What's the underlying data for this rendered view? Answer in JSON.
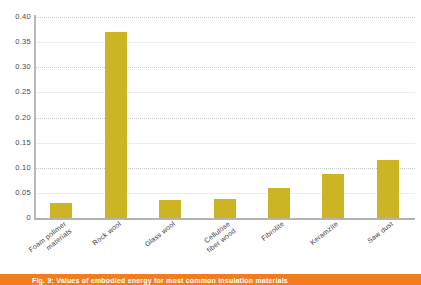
{
  "chart_data": {
    "type": "bar",
    "title": "",
    "xlabel": "",
    "ylabel": "",
    "ylim": [
      0,
      0.4
    ],
    "grid": true,
    "legend": false,
    "bar_color": "#cdb424",
    "categories": [
      "Foam polimer materials",
      "Rock wool",
      "Glass wool",
      "Cellulose fiber wood",
      "Fibrolite",
      "Keramzite",
      "Saw dust"
    ],
    "category_lines": [
      [
        "Foam polimer",
        "materials"
      ],
      [
        "Rock wool",
        ""
      ],
      [
        "Glass wool",
        ""
      ],
      [
        "Cellulose",
        "fiber wood"
      ],
      [
        "Fibrolite",
        ""
      ],
      [
        "Keramzite",
        ""
      ],
      [
        "Saw dust",
        ""
      ]
    ],
    "values": [
      0.03,
      0.37,
      0.036,
      0.038,
      0.06,
      0.087,
      0.116
    ],
    "ytick_values": [
      0.4,
      0.35,
      0.3,
      0.25,
      0.2,
      0.15,
      0.1,
      0.05,
      0
    ],
    "ytick_labels": [
      "0.40",
      "0.35",
      "0.30",
      "0.25",
      "0.20",
      "0.15",
      "0.10",
      "0.05",
      "0"
    ]
  },
  "caption": {
    "text": "Fig. 9: Values of embodied energy for most common insulation materials",
    "bar_color": "#f07d1e"
  }
}
